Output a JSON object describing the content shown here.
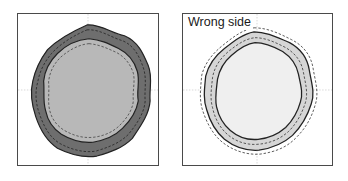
{
  "figures": [
    {
      "id": "left",
      "label": "",
      "description": "Right side of fabric: dark outer wavy ring with stitching lines around lighter inner circle",
      "colors": {
        "outer_fill": "#6e6e6e",
        "inner_fill": "#b8b8b8",
        "stroke": "#222222"
      }
    },
    {
      "id": "right",
      "label": "Wrong side",
      "description": "Wrong side of fabric: light grey wavy ring between solid outlines with dashed stitching lines, very light inner circle",
      "colors": {
        "outer_fill": "#d6d6d6",
        "inner_fill": "#efefef",
        "stroke": "#222222"
      }
    }
  ]
}
